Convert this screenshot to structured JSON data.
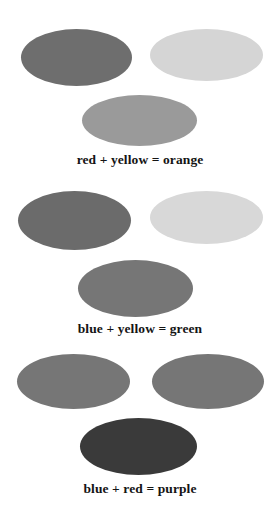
{
  "figure": {
    "background_color": "#ffffff",
    "caption_color": "#141414"
  },
  "groups": [
    {
      "id": "group-1",
      "caption": "red + yellow = orange",
      "operand_a": {
        "label": "red",
        "swatch_color": "#6e6e6e"
      },
      "operand_b": {
        "label": "yellow",
        "swatch_color": "#d5d5d5"
      },
      "result": {
        "label": "orange",
        "swatch_color": "#9a9a9a"
      }
    },
    {
      "id": "group-2",
      "caption": "blue + yellow = green",
      "operand_a": {
        "label": "blue",
        "swatch_color": "#6b6b6b"
      },
      "operand_b": {
        "label": "yellow",
        "swatch_color": "#d8d8d8"
      },
      "result": {
        "label": "green",
        "swatch_color": "#767676"
      }
    },
    {
      "id": "group-3",
      "caption": "blue + red = purple",
      "operand_a": {
        "label": "blue",
        "swatch_color": "#767676"
      },
      "operand_b": {
        "label": "red",
        "swatch_color": "#767676"
      },
      "result": {
        "label": "purple",
        "swatch_color": "#3a3a3a"
      }
    }
  ]
}
